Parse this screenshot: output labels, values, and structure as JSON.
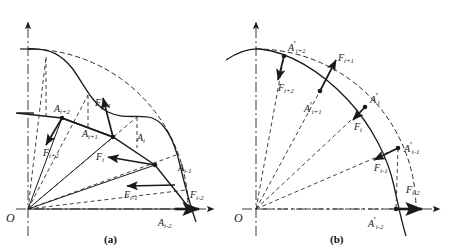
{
  "figure": {
    "panels": [
      {
        "id": "a",
        "caption": "(a)",
        "origin_label": "O",
        "point_labels": [
          {
            "name": "A-i-plus-2",
            "base": "A",
            "sub": "i+2",
            "prime": ""
          },
          {
            "name": "A-i-plus-1",
            "base": "A",
            "sub": "i+1",
            "prime": ""
          },
          {
            "name": "A-i",
            "base": "A",
            "sub": "i",
            "prime": ""
          },
          {
            "name": "A-i-minus-1",
            "base": "A",
            "sub": "i-1",
            "prime": ""
          },
          {
            "name": "A-i-minus-2",
            "base": "A",
            "sub": "i-2",
            "prime": ""
          }
        ],
        "force_labels": [
          {
            "name": "F-i-plus-2",
            "base": "F",
            "sub": "i+2"
          },
          {
            "name": "F-i-plus-1",
            "base": "F",
            "sub": "i+1"
          },
          {
            "name": "F-i",
            "base": "F",
            "sub": "i"
          },
          {
            "name": "F-i-minus-1",
            "base": "F",
            "sub": "i-1"
          },
          {
            "name": "F-i-minus-2",
            "base": "F",
            "sub": "i-2"
          }
        ]
      },
      {
        "id": "b",
        "caption": "(b)",
        "origin_label": "O",
        "point_labels": [
          {
            "name": "A-prime-i-plus-2",
            "base": "A",
            "sub": "i+2",
            "prime": "'"
          },
          {
            "name": "A-prime-i-plus-1",
            "base": "A",
            "sub": "i+1",
            "prime": "'"
          },
          {
            "name": "A-prime-i",
            "base": "A",
            "sub": "i",
            "prime": "'"
          },
          {
            "name": "A-prime-i-minus-1",
            "base": "A",
            "sub": "i-1",
            "prime": "'"
          },
          {
            "name": "A-prime-i-minus-2",
            "base": "A",
            "sub": "i-2",
            "prime": "'"
          }
        ],
        "force_labels": [
          {
            "name": "F-i-plus-2",
            "base": "F",
            "sub": "i+2"
          },
          {
            "name": "F-i-plus-1",
            "base": "F",
            "sub": "i+1"
          },
          {
            "name": "F-i",
            "base": "F",
            "sub": "i"
          },
          {
            "name": "F-i-minus-1",
            "base": "F",
            "sub": "i-1"
          },
          {
            "name": "F-i-minus-2",
            "base": "F",
            "sub": "i-2"
          }
        ]
      }
    ],
    "colors": {
      "ink": "#1a1a1a",
      "line": "#2b2b2b",
      "axis": "#3a3a3a",
      "background": "#ffffff"
    }
  }
}
